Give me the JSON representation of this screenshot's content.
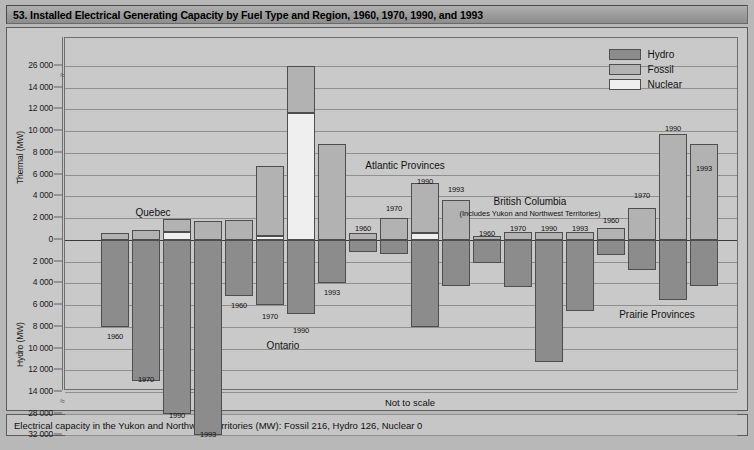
{
  "header": {
    "title": "53. Installed Electrical Generating Capacity by Fuel Type and Region, 1960, 1970, 1990, and 1993"
  },
  "footer": {
    "note": "Electrical capacity in the Yukon and Northwest Territories (MW): Fossil 216, Hydro 126, Nuclear 0"
  },
  "annotations": {
    "not_to_scale": "Not to scale"
  },
  "legend": {
    "position": "top-right",
    "items": [
      {
        "label": "Hydro",
        "color": "#8c8c8c"
      },
      {
        "label": "Fossil",
        "color": "#b2b2b2"
      },
      {
        "label": "Nuclear",
        "color": "#efefef"
      }
    ]
  },
  "axes": {
    "upper_title": "Thermal (MW)",
    "lower_title": "Hydro (MW)",
    "upper_ticks": [
      "26 000",
      "14 000",
      "12 000",
      "10 000",
      "8 000",
      "6 000",
      "4 000",
      "2 000",
      "0"
    ],
    "lower_ticks": [
      "0",
      "2 000",
      "4 000",
      "6 000",
      "8 000",
      "10 000",
      "12 000",
      "14 000",
      "28 000",
      "32 000"
    ],
    "broken_upper_between": [
      "14 000",
      "26 000"
    ],
    "broken_lower_between": [
      "14 000",
      "28 000"
    ],
    "grid": true
  },
  "chart_data": {
    "type": "bar",
    "title": "53. Installed Electrical Generating Capacity by Fuel Type and Region, 1960, 1970, 1990, and 1993",
    "subtitle": "Not to scale",
    "xlabel": "",
    "ylabel_upper": "Thermal (MW)",
    "ylabel_lower": "Hydro (MW)",
    "unit": "MW",
    "orientation": "vertical-diverging",
    "note": "Thermal (Fossil + Nuclear) plotted upward from zero; Hydro plotted downward from zero. Both axes are broken and not to scale.",
    "series_names": [
      "Hydro",
      "Fossil",
      "Nuclear"
    ],
    "regions": [
      {
        "name": "Quebec",
        "label_sub": "",
        "years": [
          {
            "year": "1960",
            "fossil": 600,
            "nuclear": 0,
            "hydro": 8000
          },
          {
            "year": "1970",
            "fossil": 900,
            "nuclear": 0,
            "hydro": 13000
          },
          {
            "year": "1990",
            "fossil": 1200,
            "nuclear": 700,
            "hydro": 28000
          },
          {
            "year": "1993",
            "fossil": 1700,
            "nuclear": 0,
            "hydro": 32000
          }
        ]
      },
      {
        "name": "Ontario",
        "label_sub": "",
        "years": [
          {
            "year": "1960",
            "fossil": 1800,
            "nuclear": 0,
            "hydro": 5200
          },
          {
            "year": "1970",
            "fossil": 6400,
            "nuclear": 400,
            "hydro": 6000
          },
          {
            "year": "1990",
            "fossil": 14400,
            "nuclear": 11600,
            "hydro": 6800
          },
          {
            "year": "1993",
            "fossil": 8800,
            "nuclear": 0,
            "hydro": 4000
          }
        ]
      },
      {
        "name": "Atlantic Provinces",
        "label_sub": "",
        "years": [
          {
            "year": "1960",
            "fossil": 600,
            "nuclear": 0,
            "hydro": 1100
          },
          {
            "year": "1970",
            "fossil": 2000,
            "nuclear": 0,
            "hydro": 1300
          },
          {
            "year": "1990",
            "fossil": 4600,
            "nuclear": 600,
            "hydro": 8000
          },
          {
            "year": "1993",
            "fossil": 3600,
            "nuclear": 0,
            "hydro": 4300
          }
        ]
      },
      {
        "name": "British Columbia",
        "label_sub": "(Includes Yukon and Northwest Territories)",
        "years": [
          {
            "year": "1960",
            "fossil": 400,
            "nuclear": 0,
            "hydro": 2100
          },
          {
            "year": "1970",
            "fossil": 700,
            "nuclear": 0,
            "hydro": 4400
          },
          {
            "year": "1990",
            "fossil": 700,
            "nuclear": 0,
            "hydro": 11200
          },
          {
            "year": "1993",
            "fossil": 700,
            "nuclear": 0,
            "hydro": 6500
          }
        ]
      },
      {
        "name": "Prairie Provinces",
        "label_sub": "",
        "years": [
          {
            "year": "1960",
            "fossil": 1100,
            "nuclear": 0,
            "hydro": 1400
          },
          {
            "year": "1970",
            "fossil": 2900,
            "nuclear": 0,
            "hydro": 2800
          },
          {
            "year": "1990",
            "fossil": 9700,
            "nuclear": 0,
            "hydro": 5500
          },
          {
            "year": "1993",
            "fossil": 8800,
            "nuclear": 0,
            "hydro": 4300
          }
        ]
      }
    ]
  },
  "render": {
    "upper_tick_px": [
      37,
      59,
      80,
      102,
      124,
      146,
      167,
      189,
      211
    ],
    "lower_tick_px": [
      211,
      233,
      254,
      276,
      298,
      320,
      341,
      363,
      385,
      406
    ],
    "zero_px": 211,
    "groups": [
      {
        "x": 36,
        "label_x": 88,
        "label_y": 178,
        "bars": [
          {
            "x": 36,
            "w": 28,
            "year_dx": 14,
            "year_y": 303
          },
          {
            "x": 67,
            "w": 28,
            "year_dx": 14,
            "year_y": 346
          },
          {
            "x": 98,
            "w": 28,
            "year_dx": 14,
            "year_y": 382
          },
          {
            "x": 129,
            "w": 28,
            "year_dx": 14,
            "year_y": 401
          }
        ]
      },
      {
        "x": 160,
        "label_x": 218,
        "label_y": 311,
        "bars": [
          {
            "x": 160,
            "w": 28,
            "year_dx": 14,
            "year_y": 272
          },
          {
            "x": 191,
            "w": 28,
            "year_dx": 14,
            "year_y": 283
          },
          {
            "x": 222,
            "w": 28,
            "year_dx": 14,
            "year_y": 297
          },
          {
            "x": 253,
            "w": 28,
            "year_dx": 14,
            "year_y": 259
          }
        ]
      },
      {
        "x": 284,
        "label_x": 340,
        "label_y": 131,
        "bars": [
          {
            "x": 284,
            "w": 28,
            "year_dx": 14,
            "year_y": 195
          },
          {
            "x": 315,
            "w": 28,
            "year_dx": 14,
            "year_y": 175
          },
          {
            "x": 346,
            "w": 28,
            "year_dx": 14,
            "year_y": 148
          },
          {
            "x": 377,
            "w": 28,
            "year_dx": 14,
            "year_y": 156
          }
        ]
      },
      {
        "x": 408,
        "label_x": 465,
        "label_y": 167,
        "bars": [
          {
            "x": 408,
            "w": 28,
            "year_dx": 14,
            "year_y": 200
          },
          {
            "x": 439,
            "w": 28,
            "year_dx": 14,
            "year_y": 195
          },
          {
            "x": 470,
            "w": 28,
            "year_dx": 14,
            "year_y": 195
          },
          {
            "x": 501,
            "w": 28,
            "year_dx": 14,
            "year_y": 195
          }
        ]
      },
      {
        "x": 532,
        "label_x": 592,
        "label_y": 280,
        "bars": [
          {
            "x": 532,
            "w": 28,
            "year_dx": 14,
            "year_y": 187
          },
          {
            "x": 563,
            "w": 28,
            "year_dx": 14,
            "year_y": 162
          },
          {
            "x": 594,
            "w": 28,
            "year_dx": 14,
            "year_y": 95
          },
          {
            "x": 625,
            "w": 28,
            "year_dx": 14,
            "year_y": 135
          }
        ]
      }
    ]
  }
}
